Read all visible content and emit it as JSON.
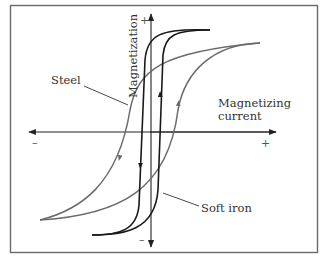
{
  "figure": {
    "y_axis": {
      "label": "Magnetization",
      "positive": "+",
      "negative": "–"
    },
    "x_axis": {
      "label_line1": "Magnetizing",
      "label_line2": "current",
      "positive": "+",
      "negative": "–"
    },
    "curves": [
      {
        "name": "Steel",
        "color": "#6b6b6b"
      },
      {
        "name": "Soft iron",
        "color": "#1a1a1a"
      }
    ]
  },
  "colors": {
    "border": "#6a6a6a",
    "axis": "#222222",
    "steel": "#6b6b6b",
    "soft_iron": "#1a1a1a"
  }
}
